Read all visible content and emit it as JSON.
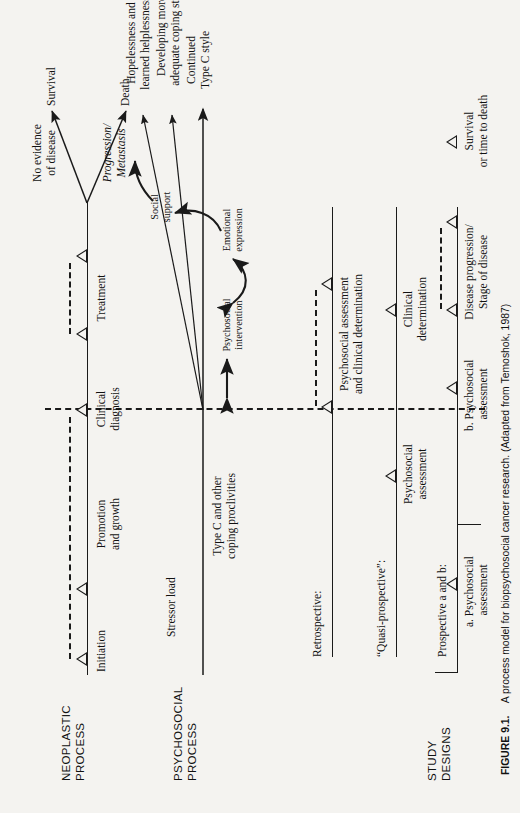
{
  "figure": {
    "number": "FIGURE 9.1.",
    "caption": "A process model for biopsychosocial cancer research. (Adapted from Temoshok, 1987)"
  },
  "rows": {
    "neoplastic_label": "NEOPLASTIC\nPROCESS",
    "psychosocial_label": "PSYCHOSOCIAL\nPROCESS",
    "study_designs_label": "STUDY\nDESIGNS"
  },
  "neoplastic": {
    "stages": [
      {
        "label": "Initiation"
      },
      {
        "label": "Promotion\nand growth"
      },
      {
        "label": "Clinical\ndiagnosis"
      },
      {
        "label": "Treatment"
      }
    ],
    "outcomes": [
      {
        "label": "No evidence\nof disease",
        "italic": false
      },
      {
        "label": "Survival",
        "italic": false
      },
      {
        "label": "Progression/\nMetastasis",
        "italic": true
      },
      {
        "label": "Death",
        "italic": false
      }
    ]
  },
  "psychosocial": {
    "antecedents": [
      {
        "label": "Stressor load"
      },
      {
        "label": "Type C and other\ncoping proclivities"
      }
    ],
    "outcomes": [
      {
        "label": "Continued\nType C style"
      },
      {
        "label": "Hopelessness and\nlearned helplessness"
      },
      {
        "label": "Developing more\nadequate coping style"
      }
    ],
    "mediators": [
      {
        "label": "Psychosocial\nintervention"
      },
      {
        "label": "Emotional\nexpression"
      },
      {
        "label": "Social\nsupport"
      }
    ]
  },
  "study_designs": [
    {
      "name": "Retrospective:",
      "measures": [
        {
          "label": "Psychosocial assessment\nand clinical determination"
        }
      ]
    },
    {
      "name": "“Quasi-prospective”:",
      "measures": [
        {
          "label": "Psychosocial\nassessment"
        },
        {
          "label": "Clinical\ndetermination"
        }
      ]
    },
    {
      "name": "Prospective a and b:",
      "measures": [
        {
          "label": "a. Psychosocial\n    assessment"
        },
        {
          "label": "b. Psychosocial\n    assessment"
        },
        {
          "label": "Disease progression/\nStage of disease"
        },
        {
          "label": "Survival\nor time to death"
        }
      ]
    }
  ],
  "colors": {
    "ink": "#1a1a1a",
    "paper": "#f4f3f0"
  }
}
